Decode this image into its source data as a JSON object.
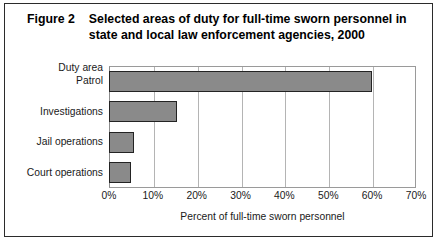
{
  "figure": {
    "label": "Figure 2",
    "title": "Selected areas of duty for full-time sworn personnel in state and local law enforcement agencies, 2000",
    "category_axis_header": "Duty area"
  },
  "chart_data": {
    "type": "bar",
    "orientation": "horizontal",
    "title": "Selected areas of duty for full-time sworn personnel in state and local law enforcement agencies, 2000",
    "categories": [
      "Patrol",
      "Investigations",
      "Jail operations",
      "Court operations"
    ],
    "values": [
      60,
      15.5,
      5.8,
      5
    ],
    "series": [
      {
        "name": "Percent of full-time sworn personnel",
        "values": [
          60,
          15.5,
          5.8,
          5
        ]
      }
    ],
    "xlabel": "Percent of full-time sworn personnel",
    "ylabel": "Duty area",
    "xlim": [
      0,
      70
    ],
    "ylim": null,
    "xticks": [
      0,
      10,
      20,
      30,
      40,
      50,
      60,
      70
    ],
    "xticklabels": [
      "0%",
      "10%",
      "20%",
      "30%",
      "40%",
      "50%",
      "60%",
      "70%"
    ],
    "grid": true,
    "grid_axis": "x",
    "legend": false,
    "bar_fill_color": "#8a8a8a",
    "bar_edge_color": "#232323",
    "gridline_color": "#b4b4b4",
    "frame_color": "#2b2b2b"
  }
}
